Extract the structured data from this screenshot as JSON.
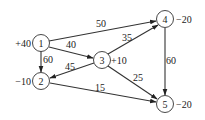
{
  "diagram": {
    "type": "network-flow",
    "nodes": [
      {
        "id": "1",
        "label": "1",
        "supply": "+40",
        "x": 41,
        "y": 43
      },
      {
        "id": "2",
        "label": "2",
        "supply": "−10",
        "x": 41,
        "y": 81
      },
      {
        "id": "3",
        "label": "3",
        "supply": "+10",
        "x": 102,
        "y": 60
      },
      {
        "id": "4",
        "label": "4",
        "supply": "−20",
        "x": 165,
        "y": 19
      },
      {
        "id": "5",
        "label": "5",
        "supply": "−20",
        "x": 165,
        "y": 104
      }
    ],
    "edges": [
      {
        "from": "1",
        "to": "4",
        "cost": "50"
      },
      {
        "from": "1",
        "to": "3",
        "cost": "40"
      },
      {
        "from": "1",
        "to": "2",
        "cost": "60"
      },
      {
        "from": "3",
        "to": "2",
        "cost": "45"
      },
      {
        "from": "3",
        "to": "4",
        "cost": "35"
      },
      {
        "from": "3",
        "to": "5",
        "cost": "25"
      },
      {
        "from": "2",
        "to": "5",
        "cost": "15"
      },
      {
        "from": "4",
        "to": "5",
        "cost": "60"
      }
    ]
  }
}
